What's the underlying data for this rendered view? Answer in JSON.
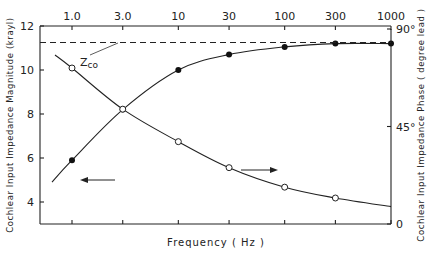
{
  "chart_data": {
    "type": "line",
    "title": "",
    "xlabel": "Frequency (Hz)",
    "xscale": "log",
    "x_ticks": [
      "1.0",
      "3.0",
      "10",
      "30",
      "100",
      "300",
      "1000"
    ],
    "x": [
      1,
      3,
      10,
      30,
      100,
      300,
      1000
    ],
    "ylabel_left": "Cochlear Input Impedance Magnitude (krayl)",
    "ylim_left": [
      3,
      12
    ],
    "y_ticks_left": [
      "12",
      "10",
      "8",
      "6",
      "4"
    ],
    "ylabel_right": "Cochlear Input Impedance Phase ( degree lead )",
    "ylim_right": [
      0,
      90
    ],
    "y_ticks_right": [
      "90°",
      "45°",
      "0"
    ],
    "grid": false,
    "series": [
      {
        "name": "Magnitude",
        "axis": "left",
        "marker": "filled-circle",
        "x": [
          1,
          3,
          10,
          30,
          100,
          300,
          1000
        ],
        "values": [
          5.9,
          8.2,
          10.0,
          10.7,
          11.05,
          11.2,
          11.2
        ]
      },
      {
        "name": "Phase",
        "axis": "right",
        "marker": "open-circle",
        "x": [
          1,
          3,
          10,
          30,
          100,
          300
        ],
        "values": [
          72,
          53,
          38,
          26,
          17,
          12
        ]
      }
    ],
    "annotations": [
      {
        "text": "Zco",
        "type": "dashed-hline",
        "axis": "left",
        "value": 11.25
      },
      {
        "text": "←",
        "meaning": "magnitude curve reads left axis"
      },
      {
        "text": "→",
        "meaning": "phase curve reads right axis"
      }
    ]
  },
  "labels": {
    "zco_main": "Z",
    "zco_sub": "co",
    "x_title": "Frequency ( Hz )",
    "y_left_title": "Cochlear Input Impedance Magnitude (krayl)",
    "y_right_title": "Cochlear Input Impedance Phase ( degree lead )"
  }
}
